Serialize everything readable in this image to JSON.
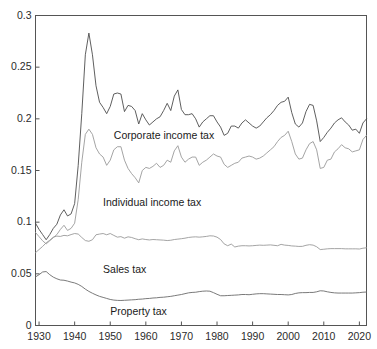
{
  "chart_data": {
    "type": "line",
    "title": "",
    "xlabel": "",
    "ylabel": "",
    "xlim": [
      1929,
      2022
    ],
    "ylim": [
      0,
      0.3
    ],
    "grid": false,
    "legend_position": "inline-annotations",
    "xticks": [
      1930,
      1940,
      1950,
      1960,
      1970,
      1980,
      1990,
      2000,
      2010,
      2020
    ],
    "xticklabels": [
      "1930",
      "1940",
      "1950",
      "1960",
      "1970",
      "1980",
      "1990",
      "2000",
      "2010",
      "2020"
    ],
    "yticks": [
      0,
      0.05,
      0.1,
      0.15,
      0.2,
      0.25,
      0.3
    ],
    "yticklabels": [
      "0",
      "0.05",
      "0.1",
      "0.15",
      "0.2",
      "0.25",
      "0.3"
    ],
    "annotations": [
      {
        "text": "Corporate income tax",
        "x": 1951,
        "y": 0.183
      },
      {
        "text": "Individual income tax",
        "x": 1948,
        "y": 0.119
      },
      {
        "text": "Sales tax",
        "x": 1948,
        "y": 0.054
      },
      {
        "text": "Property tax",
        "x": 1950,
        "y": 0.0135
      }
    ],
    "series": [
      {
        "name": "Corporate income tax",
        "color": "#4d4d4d",
        "x": [
          1929,
          1930,
          1931,
          1932,
          1933,
          1934,
          1935,
          1936,
          1937,
          1938,
          1939,
          1940,
          1941,
          1942,
          1943,
          1944,
          1945,
          1946,
          1947,
          1948,
          1949,
          1950,
          1951,
          1952,
          1953,
          1954,
          1955,
          1956,
          1957,
          1958,
          1959,
          1960,
          1961,
          1962,
          1963,
          1964,
          1965,
          1966,
          1967,
          1968,
          1969,
          1970,
          1971,
          1972,
          1973,
          1974,
          1975,
          1976,
          1977,
          1978,
          1979,
          1980,
          1981,
          1982,
          1983,
          1984,
          1985,
          1986,
          1987,
          1988,
          1989,
          1990,
          1991,
          1992,
          1993,
          1994,
          1995,
          1996,
          1997,
          1998,
          1999,
          2000,
          2001,
          2002,
          2003,
          2004,
          2005,
          2006,
          2007,
          2008,
          2009,
          2010,
          2011,
          2012,
          2013,
          2014,
          2015,
          2016,
          2017,
          2018,
          2019,
          2020,
          2021,
          2022
        ],
        "y": [
          0.099,
          0.093,
          0.088,
          0.083,
          0.088,
          0.094,
          0.098,
          0.107,
          0.112,
          0.106,
          0.108,
          0.118,
          0.155,
          0.205,
          0.262,
          0.283,
          0.262,
          0.232,
          0.216,
          0.211,
          0.205,
          0.212,
          0.224,
          0.225,
          0.224,
          0.207,
          0.213,
          0.212,
          0.208,
          0.195,
          0.205,
          0.199,
          0.194,
          0.197,
          0.2,
          0.202,
          0.208,
          0.215,
          0.208,
          0.222,
          0.228,
          0.209,
          0.204,
          0.204,
          0.205,
          0.2,
          0.192,
          0.197,
          0.2,
          0.203,
          0.203,
          0.197,
          0.192,
          0.184,
          0.186,
          0.193,
          0.193,
          0.191,
          0.196,
          0.199,
          0.196,
          0.193,
          0.191,
          0.193,
          0.197,
          0.201,
          0.204,
          0.208,
          0.213,
          0.216,
          0.217,
          0.221,
          0.206,
          0.195,
          0.192,
          0.196,
          0.207,
          0.214,
          0.213,
          0.198,
          0.178,
          0.182,
          0.187,
          0.191,
          0.196,
          0.199,
          0.201,
          0.197,
          0.194,
          0.189,
          0.19,
          0.186,
          0.196,
          0.2
        ]
      },
      {
        "name": "Individual income tax",
        "color": "#9a9a9a",
        "x": [
          1929,
          1930,
          1931,
          1932,
          1933,
          1934,
          1935,
          1936,
          1937,
          1938,
          1939,
          1940,
          1941,
          1942,
          1943,
          1944,
          1945,
          1946,
          1947,
          1948,
          1949,
          1950,
          1951,
          1952,
          1953,
          1954,
          1955,
          1956,
          1957,
          1958,
          1959,
          1960,
          1961,
          1962,
          1963,
          1964,
          1965,
          1966,
          1967,
          1968,
          1969,
          1970,
          1971,
          1972,
          1973,
          1974,
          1975,
          1976,
          1977,
          1978,
          1979,
          1980,
          1981,
          1982,
          1983,
          1984,
          1985,
          1986,
          1987,
          1988,
          1989,
          1990,
          1991,
          1992,
          1993,
          1994,
          1995,
          1996,
          1997,
          1998,
          1999,
          2000,
          2001,
          2002,
          2003,
          2004,
          2005,
          2006,
          2007,
          2008,
          2009,
          2010,
          2011,
          2012,
          2013,
          2014,
          2015,
          2016,
          2017,
          2018,
          2019,
          2020,
          2021,
          2022
        ],
        "y": [
          0.09,
          0.086,
          0.082,
          0.079,
          0.082,
          0.085,
          0.088,
          0.093,
          0.097,
          0.092,
          0.094,
          0.099,
          0.122,
          0.158,
          0.185,
          0.19,
          0.185,
          0.172,
          0.166,
          0.163,
          0.155,
          0.16,
          0.17,
          0.173,
          0.173,
          0.16,
          0.152,
          0.147,
          0.143,
          0.138,
          0.15,
          0.153,
          0.152,
          0.154,
          0.157,
          0.153,
          0.155,
          0.16,
          0.158,
          0.169,
          0.174,
          0.163,
          0.158,
          0.161,
          0.163,
          0.163,
          0.155,
          0.158,
          0.16,
          0.163,
          0.166,
          0.164,
          0.163,
          0.156,
          0.153,
          0.155,
          0.157,
          0.158,
          0.162,
          0.163,
          0.164,
          0.163,
          0.161,
          0.162,
          0.164,
          0.167,
          0.17,
          0.173,
          0.178,
          0.182,
          0.184,
          0.188,
          0.178,
          0.166,
          0.161,
          0.162,
          0.17,
          0.176,
          0.178,
          0.17,
          0.152,
          0.153,
          0.16,
          0.161,
          0.168,
          0.171,
          0.175,
          0.172,
          0.171,
          0.168,
          0.169,
          0.17,
          0.18,
          0.184
        ]
      },
      {
        "name": "Sales tax",
        "color": "#9a9a9a",
        "x": [
          1929,
          1930,
          1931,
          1932,
          1933,
          1934,
          1935,
          1936,
          1937,
          1938,
          1939,
          1940,
          1941,
          1942,
          1943,
          1944,
          1945,
          1946,
          1947,
          1948,
          1949,
          1950,
          1951,
          1952,
          1953,
          1954,
          1955,
          1956,
          1957,
          1958,
          1959,
          1960,
          1961,
          1962,
          1963,
          1964,
          1965,
          1966,
          1967,
          1968,
          1969,
          1970,
          1971,
          1972,
          1973,
          1974,
          1975,
          1976,
          1977,
          1978,
          1979,
          1980,
          1981,
          1982,
          1983,
          1984,
          1985,
          1986,
          1987,
          1988,
          1989,
          1990,
          1991,
          1992,
          1993,
          1994,
          1995,
          1996,
          1997,
          1998,
          1999,
          2000,
          2001,
          2002,
          2003,
          2004,
          2005,
          2006,
          2007,
          2008,
          2009,
          2010,
          2011,
          2012,
          2013,
          2014,
          2015,
          2016,
          2017,
          2018,
          2019,
          2020,
          2021,
          2022
        ],
        "y": [
          0.0705,
          0.0735,
          0.0765,
          0.08,
          0.0825,
          0.0855,
          0.0865,
          0.0862,
          0.0872,
          0.0868,
          0.088,
          0.089,
          0.0885,
          0.0852,
          0.0822,
          0.0815,
          0.083,
          0.0878,
          0.0885,
          0.089,
          0.0878,
          0.089,
          0.0872,
          0.0855,
          0.086,
          0.0845,
          0.0858,
          0.0852,
          0.084,
          0.083,
          0.0838,
          0.0832,
          0.0828,
          0.0832,
          0.083,
          0.0828,
          0.0826,
          0.0822,
          0.0825,
          0.0832,
          0.0836,
          0.084,
          0.0845,
          0.0852,
          0.0856,
          0.0858,
          0.0855,
          0.0858,
          0.0862,
          0.0868,
          0.0866,
          0.0855,
          0.0832,
          0.079,
          0.0772,
          0.0788,
          0.076,
          0.0768,
          0.0772,
          0.0772,
          0.077,
          0.0772,
          0.0775,
          0.0778,
          0.0776,
          0.0778,
          0.078,
          0.0776,
          0.0772,
          0.0785,
          0.0778,
          0.0775,
          0.077,
          0.0768,
          0.0765,
          0.0766,
          0.0776,
          0.0782,
          0.0778,
          0.0762,
          0.0735,
          0.0738,
          0.0742,
          0.0744,
          0.0744,
          0.0744,
          0.0744,
          0.0742,
          0.0742,
          0.0742,
          0.0742,
          0.074,
          0.0748,
          0.0752
        ]
      },
      {
        "name": "Property tax",
        "color": "#6b6b6b",
        "x": [
          1929,
          1930,
          1931,
          1932,
          1933,
          1934,
          1935,
          1936,
          1937,
          1938,
          1939,
          1940,
          1941,
          1942,
          1943,
          1944,
          1945,
          1946,
          1947,
          1948,
          1949,
          1950,
          1951,
          1952,
          1953,
          1954,
          1955,
          1956,
          1957,
          1958,
          1959,
          1960,
          1961,
          1962,
          1963,
          1964,
          1965,
          1966,
          1967,
          1968,
          1969,
          1970,
          1971,
          1972,
          1973,
          1974,
          1975,
          1976,
          1977,
          1978,
          1979,
          1980,
          1981,
          1982,
          1983,
          1984,
          1985,
          1986,
          1987,
          1988,
          1989,
          1990,
          1991,
          1992,
          1993,
          1994,
          1995,
          1996,
          1997,
          1998,
          1999,
          2000,
          2001,
          2002,
          2003,
          2004,
          2005,
          2006,
          2007,
          2008,
          2009,
          2010,
          2011,
          2012,
          2013,
          2014,
          2015,
          2016,
          2017,
          2018,
          2019,
          2020,
          2021,
          2022
        ],
        "y": [
          0.047,
          0.0492,
          0.0518,
          0.0522,
          0.0492,
          0.0468,
          0.0452,
          0.044,
          0.0438,
          0.043,
          0.042,
          0.0412,
          0.0398,
          0.0378,
          0.0352,
          0.033,
          0.0312,
          0.0296,
          0.0282,
          0.0272,
          0.0262,
          0.0252,
          0.0246,
          0.0243,
          0.0242,
          0.0244,
          0.0246,
          0.0248,
          0.025,
          0.0254,
          0.0256,
          0.026,
          0.0262,
          0.0266,
          0.0268,
          0.0272,
          0.0274,
          0.0278,
          0.0282,
          0.0288,
          0.0294,
          0.03,
          0.0308,
          0.0316,
          0.032,
          0.0322,
          0.0328,
          0.0332,
          0.0334,
          0.0332,
          0.0318,
          0.0302,
          0.0288,
          0.0288,
          0.029,
          0.0292,
          0.0294,
          0.0296,
          0.03,
          0.03,
          0.0298,
          0.0302,
          0.0306,
          0.0308,
          0.0308,
          0.0306,
          0.0304,
          0.0302,
          0.03,
          0.03,
          0.0298,
          0.0296,
          0.03,
          0.031,
          0.0316,
          0.0318,
          0.0318,
          0.032,
          0.032,
          0.0326,
          0.0336,
          0.0334,
          0.0326,
          0.032,
          0.0316,
          0.0314,
          0.0314,
          0.0314,
          0.0314,
          0.0314,
          0.0316,
          0.0318,
          0.0322,
          0.0324
        ]
      }
    ]
  },
  "axes": {
    "frame_color": "#555555",
    "background": "#ffffff"
  }
}
